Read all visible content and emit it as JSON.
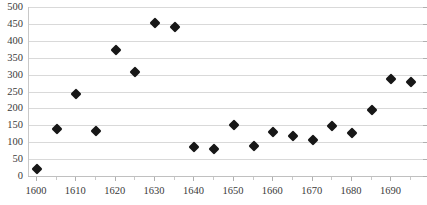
{
  "chart_data": {
    "type": "scatter",
    "title": "",
    "subtitle": "",
    "xlabel": "",
    "ylabel": "",
    "xlim": [
      1598,
      1698
    ],
    "ylim": [
      0,
      500
    ],
    "ytick_interval": 50,
    "xtick_interval": 10,
    "x_minor_tick_interval": 5,
    "grid": true,
    "legend": false,
    "legend_position": "none",
    "marker": "diamond",
    "marker_color": "#171717",
    "gridline_color": "#d9d9d9",
    "axis_color": "#b0b0b0",
    "background_color": "#ffffff",
    "x": [
      1600,
      1605,
      1610,
      1615,
      1620,
      1625,
      1630,
      1635,
      1640,
      1645,
      1650,
      1655,
      1660,
      1665,
      1670,
      1675,
      1680,
      1685,
      1690,
      1695
    ],
    "values": [
      20,
      139,
      242,
      133,
      372,
      309,
      454,
      440,
      85,
      81,
      151,
      88,
      130,
      119,
      106,
      149,
      128,
      194,
      286,
      278
    ],
    "yticks": [
      0,
      50,
      100,
      150,
      200,
      250,
      300,
      350,
      400,
      450,
      500
    ],
    "ytick_labels": [
      "0",
      "50",
      "100",
      "150",
      "200",
      "250",
      "300",
      "350",
      "400",
      "450",
      "500"
    ],
    "xticks": [
      1600,
      1610,
      1620,
      1630,
      1640,
      1650,
      1660,
      1670,
      1680,
      1690
    ],
    "xtick_labels": [
      "1600",
      "1610",
      "1620",
      "1630",
      "1640",
      "1650",
      "1660",
      "1670",
      "1680",
      "1690"
    ],
    "x_minor_ticks": [
      1605,
      1615,
      1625,
      1635,
      1645,
      1655,
      1665,
      1675,
      1685,
      1695
    ]
  }
}
